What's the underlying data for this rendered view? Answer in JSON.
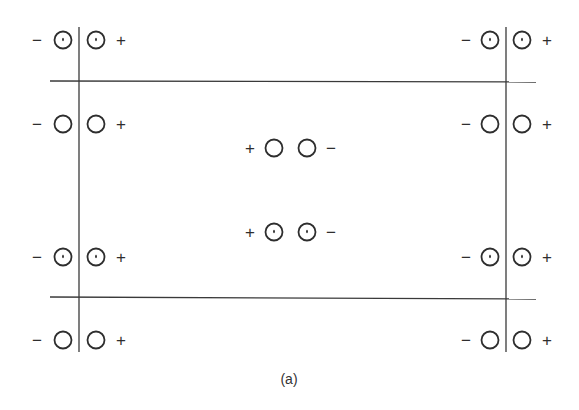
{
  "figure": {
    "caption": "(a)",
    "colors": {
      "ink": "#2e2e2e",
      "background": "#ffffff"
    },
    "lines": [
      {
        "id": "left-vertical",
        "x1": 79,
        "y1": 27,
        "x2": 79,
        "y2": 352
      },
      {
        "id": "right-vertical",
        "x1": 506,
        "y1": 27,
        "x2": 506,
        "y2": 352
      },
      {
        "id": "top-horizontal",
        "x1": 50,
        "y1": 81,
        "x2": 536,
        "y2": 82
      },
      {
        "id": "bottom-horizontal",
        "x1": 50,
        "y1": 297,
        "x2": 536,
        "y2": 299
      }
    ],
    "groups": [
      {
        "id": "top-left-row1",
        "y": 40,
        "left_sign": "−",
        "right_sign": "+",
        "dotted": true,
        "sign_left_x": 37,
        "c1x": 63,
        "c2x": 96,
        "sign_right_x": 121
      },
      {
        "id": "top-left-row2",
        "y": 124,
        "left_sign": "−",
        "right_sign": "+",
        "dotted": false,
        "sign_left_x": 37,
        "c1x": 63,
        "c2x": 96,
        "sign_right_x": 121
      },
      {
        "id": "bottom-left-row1",
        "y": 257,
        "left_sign": "−",
        "right_sign": "+",
        "dotted": true,
        "sign_left_x": 37,
        "c1x": 63,
        "c2x": 96,
        "sign_right_x": 121
      },
      {
        "id": "bottom-left-row2",
        "y": 340,
        "left_sign": "−",
        "right_sign": "+",
        "dotted": false,
        "sign_left_x": 37,
        "c1x": 63,
        "c2x": 96,
        "sign_right_x": 121
      },
      {
        "id": "top-right-row1",
        "y": 40,
        "left_sign": "−",
        "right_sign": "+",
        "dotted": true,
        "sign_left_x": 466,
        "c1x": 490,
        "c2x": 522,
        "sign_right_x": 547
      },
      {
        "id": "top-right-row2",
        "y": 124,
        "left_sign": "−",
        "right_sign": "+",
        "dotted": false,
        "sign_left_x": 466,
        "c1x": 490,
        "c2x": 522,
        "sign_right_x": 547
      },
      {
        "id": "bottom-right-row1",
        "y": 257,
        "left_sign": "−",
        "right_sign": "+",
        "dotted": true,
        "sign_left_x": 466,
        "c1x": 490,
        "c2x": 522,
        "sign_right_x": 547
      },
      {
        "id": "bottom-right-row2",
        "y": 340,
        "left_sign": "−",
        "right_sign": "+",
        "dotted": false,
        "sign_left_x": 466,
        "c1x": 490,
        "c2x": 522,
        "sign_right_x": 547
      },
      {
        "id": "center-row1",
        "y": 148,
        "left_sign": "+",
        "right_sign": "−",
        "dotted": false,
        "sign_left_x": 250,
        "c1x": 274,
        "c2x": 307,
        "sign_right_x": 331
      },
      {
        "id": "center-row2",
        "y": 232,
        "left_sign": "+",
        "right_sign": "−",
        "dotted": true,
        "sign_left_x": 250,
        "c1x": 274,
        "c2x": 307,
        "sign_right_x": 331
      }
    ],
    "circle_radius": 8.5,
    "caption_pos": {
      "x": 289,
      "y": 384
    }
  }
}
